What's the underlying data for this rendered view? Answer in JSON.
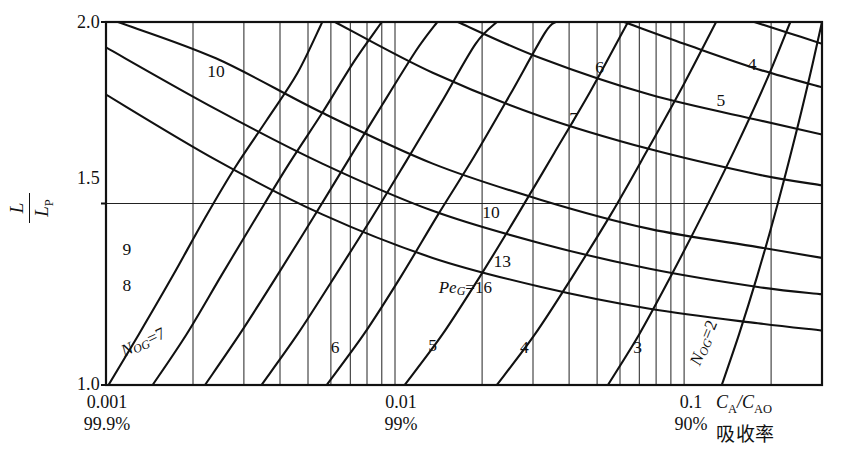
{
  "figure": {
    "kind": "nomograph",
    "y_axis": {
      "label_num": "L",
      "label_den": "L",
      "label_den_sub": "P",
      "ticks": [
        "2.0",
        "1.5",
        "1.0"
      ]
    },
    "x_axis": {
      "ratio_num": "C",
      "ratio_num_sub": "A",
      "ratio_den": "C",
      "ratio_den_sub": "AO",
      "caption_cn": "吸收率",
      "decades": [
        {
          "value": "0.001",
          "percent": "99.9%"
        },
        {
          "value": "0.01",
          "percent": "99%"
        },
        {
          "value": "0.1",
          "percent": "90%"
        }
      ]
    },
    "family_rising": {
      "name_italic": "N",
      "name_sub": "OG",
      "label_low": "N_OG=7",
      "label_high": "N_OG=2"
    },
    "family_falling": {
      "name_italic": "Pe",
      "name_sub": "G",
      "label": "Pe_G=16"
    }
  },
  "chart_data": {
    "type": "line",
    "title": "",
    "xlabel": "C_A / C_AO  (吸收率)",
    "ylabel": "L / L_P",
    "xscale": "log",
    "xlim": [
      0.001,
      0.3
    ],
    "ylim": [
      1.0,
      2.0
    ],
    "xticks": [
      0.001,
      0.01,
      0.1
    ],
    "xticklabels": [
      "0.001",
      "0.01",
      "0.1"
    ],
    "xtick_secondary": [
      "99.9%",
      "99%",
      "90%"
    ],
    "yticks": [
      1.0,
      1.5,
      2.0
    ],
    "yticklabels": [
      "1.0",
      "1.5",
      "2.0"
    ],
    "grid": "log-minor-vertical",
    "gridlines_x": [
      0.001,
      0.002,
      0.003,
      0.004,
      0.005,
      0.006,
      0.007,
      0.008,
      0.009,
      0.01,
      0.02,
      0.03,
      0.04,
      0.05,
      0.06,
      0.07,
      0.08,
      0.09,
      0.1,
      0.2,
      0.3
    ],
    "gridlines_y": [
      1.5
    ],
    "legend": "inline curve labels",
    "series": [
      {
        "name": "N_OG=10",
        "family": "N_OG",
        "value": 10,
        "label": "10",
        "label_x": 0.0024,
        "label_y": 1.86,
        "points": [
          [
            0.00102,
            1.0
          ],
          [
            0.0013,
            1.14
          ],
          [
            0.0017,
            1.3
          ],
          [
            0.0022,
            1.46
          ],
          [
            0.0028,
            1.6
          ],
          [
            0.0036,
            1.73
          ],
          [
            0.0046,
            1.86
          ],
          [
            0.0056,
            2.0
          ]
        ]
      },
      {
        "name": "N_OG=9",
        "family": "N_OG",
        "value": 9,
        "label": "9",
        "label_x": 0.00118,
        "label_y": 1.37,
        "points": [
          [
            0.00145,
            1.0
          ],
          [
            0.0019,
            1.14
          ],
          [
            0.0025,
            1.3
          ],
          [
            0.0033,
            1.46
          ],
          [
            0.0043,
            1.61
          ],
          [
            0.0056,
            1.75
          ],
          [
            0.0072,
            1.89
          ],
          [
            0.009,
            2.0
          ]
        ]
      },
      {
        "name": "N_OG=8",
        "family": "N_OG",
        "value": 8,
        "label": "8",
        "label_x": 0.00118,
        "label_y": 1.27,
        "points": [
          [
            0.0022,
            1.0
          ],
          [
            0.0029,
            1.14
          ],
          [
            0.0039,
            1.3
          ],
          [
            0.0052,
            1.46
          ],
          [
            0.0069,
            1.62
          ],
          [
            0.009,
            1.77
          ],
          [
            0.0118,
            1.92
          ],
          [
            0.014,
            2.0
          ]
        ]
      },
      {
        "name": "N_OG=7",
        "family": "N_OG",
        "value": 7,
        "label": "N_OG=7",
        "label_x": 0.00135,
        "label_y": 1.115,
        "points": [
          [
            0.00345,
            1.0
          ],
          [
            0.0046,
            1.14
          ],
          [
            0.0062,
            1.3
          ],
          [
            0.0083,
            1.46
          ],
          [
            0.011,
            1.62
          ],
          [
            0.0145,
            1.78
          ],
          [
            0.019,
            1.94
          ],
          [
            0.0225,
            2.0
          ]
        ]
      },
      {
        "name": "N_OG=6",
        "family": "N_OG",
        "value": 6,
        "label": "6",
        "label_x": 0.0062,
        "label_y": 1.1,
        "points": [
          [
            0.0058,
            1.0
          ],
          [
            0.0078,
            1.14
          ],
          [
            0.0105,
            1.3
          ],
          [
            0.0141,
            1.47
          ],
          [
            0.0188,
            1.63
          ],
          [
            0.025,
            1.8
          ],
          [
            0.033,
            1.97
          ],
          [
            0.036,
            2.0
          ]
        ]
      },
      {
        "name": "N_OG=5",
        "family": "N_OG",
        "value": 5,
        "label": "5",
        "label_x": 0.0135,
        "label_y": 1.105,
        "points": [
          [
            0.0108,
            1.0
          ],
          [
            0.0146,
            1.14
          ],
          [
            0.0197,
            1.3
          ],
          [
            0.0266,
            1.47
          ],
          [
            0.0356,
            1.64
          ],
          [
            0.0475,
            1.81
          ],
          [
            0.062,
            1.98
          ],
          [
            0.064,
            2.0
          ]
        ]
      },
      {
        "name": "N_OG=4",
        "family": "N_OG",
        "value": 4,
        "label": "4",
        "label_x": 0.028,
        "label_y": 1.1,
        "points": [
          [
            0.0225,
            1.0
          ],
          [
            0.0305,
            1.14
          ],
          [
            0.0412,
            1.3
          ],
          [
            0.0558,
            1.47
          ],
          [
            0.075,
            1.65
          ],
          [
            0.1,
            1.83
          ],
          [
            0.129,
            2.0
          ]
        ]
      },
      {
        "name": "N_OG=3",
        "family": "N_OG",
        "value": 3,
        "label": "3",
        "label_x": 0.069,
        "label_y": 1.1,
        "points": [
          [
            0.0545,
            1.0
          ],
          [
            0.07,
            1.14
          ],
          [
            0.09,
            1.3
          ],
          [
            0.116,
            1.47
          ],
          [
            0.15,
            1.65
          ],
          [
            0.193,
            1.84
          ],
          [
            0.233,
            2.0
          ]
        ]
      },
      {
        "name": "N_OG=2",
        "family": "N_OG",
        "value": 2,
        "label": "N_OG=2",
        "label_x": 0.118,
        "label_y": 1.115,
        "points": [
          [
            0.135,
            1.0
          ],
          [
            0.155,
            1.14
          ],
          [
            0.179,
            1.3
          ],
          [
            0.206,
            1.47
          ],
          [
            0.238,
            1.66
          ],
          [
            0.272,
            1.85
          ],
          [
            0.3,
            2.0
          ]
        ]
      },
      {
        "name": "Pe_G=16",
        "family": "Pe_G",
        "value": 16,
        "label": "Pe_G=16",
        "label_x": 0.0175,
        "label_y": 1.265,
        "points": [
          [
            0.001,
            1.8
          ],
          [
            0.0024,
            1.62
          ],
          [
            0.0056,
            1.47
          ],
          [
            0.0135,
            1.35
          ],
          [
            0.032,
            1.27
          ],
          [
            0.076,
            1.21
          ],
          [
            0.18,
            1.17
          ],
          [
            0.3,
            1.15
          ]
        ]
      },
      {
        "name": "Pe_G=13",
        "family": "Pe_G",
        "value": 13,
        "label": "13",
        "label_x": 0.0235,
        "label_y": 1.335,
        "points": [
          [
            0.001,
            1.93
          ],
          [
            0.0024,
            1.76
          ],
          [
            0.0056,
            1.61
          ],
          [
            0.0135,
            1.48
          ],
          [
            0.032,
            1.39
          ],
          [
            0.076,
            1.32
          ],
          [
            0.18,
            1.27
          ],
          [
            0.3,
            1.25
          ]
        ]
      },
      {
        "name": "Pe_G=10",
        "family": "Pe_G",
        "value": 10,
        "label": "10",
        "label_x": 0.0215,
        "label_y": 1.47,
        "points": [
          [
            0.0011,
            2.0
          ],
          [
            0.0024,
            1.9
          ],
          [
            0.0056,
            1.75
          ],
          [
            0.0135,
            1.61
          ],
          [
            0.032,
            1.51
          ],
          [
            0.076,
            1.43
          ],
          [
            0.18,
            1.38
          ],
          [
            0.3,
            1.35
          ]
        ]
      },
      {
        "name": "Pe_G=7",
        "family": "Pe_G",
        "value": 7,
        "label": "7",
        "label_x": 0.0415,
        "label_y": 1.73,
        "points": [
          [
            0.0062,
            2.0
          ],
          [
            0.0135,
            1.86
          ],
          [
            0.032,
            1.74
          ],
          [
            0.076,
            1.65
          ],
          [
            0.18,
            1.58
          ],
          [
            0.3,
            1.55
          ]
        ]
      },
      {
        "name": "Pe_G=6",
        "family": "Pe_G",
        "value": 6,
        "label": "6",
        "label_x": 0.051,
        "label_y": 1.87,
        "points": [
          [
            0.0165,
            2.0
          ],
          [
            0.032,
            1.9
          ],
          [
            0.076,
            1.8
          ],
          [
            0.18,
            1.73
          ],
          [
            0.3,
            1.69
          ]
        ]
      },
      {
        "name": "Pe_G=5",
        "family": "Pe_G",
        "value": 5,
        "label": "5",
        "label_x": 0.134,
        "label_y": 1.78,
        "points": [
          [
            0.062,
            2.0
          ],
          [
            0.1,
            1.94
          ],
          [
            0.18,
            1.87
          ],
          [
            0.3,
            1.82
          ]
        ]
      },
      {
        "name": "Pe_G=4",
        "family": "Pe_G",
        "value": 4,
        "label": "4",
        "label_x": 0.172,
        "label_y": 1.88,
        "points": [
          [
            0.175,
            2.0
          ],
          [
            0.23,
            1.97
          ],
          [
            0.3,
            1.94
          ]
        ]
      }
    ]
  }
}
